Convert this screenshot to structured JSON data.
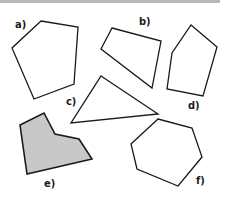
{
  "figure": {
    "top_rule_color": "#b8b8b8",
    "stroke_color": "#1a1a1a",
    "fill_color_shaded": "#c8c8c8",
    "shapes": [
      {
        "label": "a)",
        "kind": "pentagon",
        "shaded": false,
        "points": "41,21 78,27 74,84 34,99 12,48",
        "label_pos": [
          15,
          28
        ]
      },
      {
        "label": "b)",
        "kind": "quadrilateral",
        "shaded": false,
        "points": "112,28 161,41 152,88 101,49",
        "label_pos": [
          139,
          25
        ]
      },
      {
        "label": "c)",
        "kind": "triangle",
        "shaded": false,
        "points": "101,76 158,114 71,123",
        "label_pos": [
          66,
          105
        ]
      },
      {
        "label": "d)",
        "kind": "pentagon",
        "shaded": false,
        "points": "191,25 217,47 203,96 167,89 172,53",
        "label_pos": [
          188,
          109
        ]
      },
      {
        "label": "e)",
        "kind": "hexagon",
        "shaded": true,
        "points": "20,125 44,113 55,134 79,139 92,159 27,174",
        "label_pos": [
          44,
          187
        ]
      },
      {
        "label": "f)",
        "kind": "hexagon",
        "shaded": false,
        "points": "158,119 192,128 202,157 178,186 137,169 131,144",
        "label_pos": [
          196,
          184
        ]
      }
    ]
  }
}
